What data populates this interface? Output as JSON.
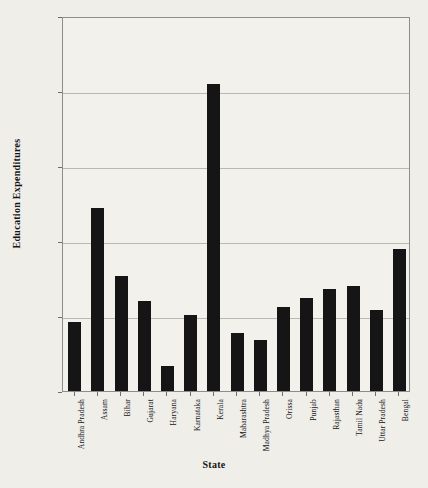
{
  "chart_data": {
    "type": "bar",
    "title": "",
    "xlabel": "State",
    "ylabel": "Education Expenditures",
    "categories": [
      "Andhra Pradesh",
      "Assam",
      "Bihar",
      "Gujarat",
      "Haryana",
      "Karnataka",
      "Kerala",
      "Maharashtra",
      "Madhya Pradesh",
      "Orissa",
      "Punjab",
      "Rajasthan",
      "Tamil Nadu",
      "Uttar Pradesh",
      "Bengal"
    ],
    "values": [
      0.196,
      0.272,
      0.227,
      0.21,
      0.167,
      0.201,
      0.355,
      0.189,
      0.184,
      0.206,
      0.212,
      0.218,
      0.22,
      0.204,
      0.245
    ],
    "ylim": [
      0.15,
      0.4
    ],
    "yticks": [
      0.15,
      0.2,
      0.25,
      0.3,
      0.35,
      0.4
    ],
    "ytick_labels": [
      "0.15",
      "0.2",
      "0.25",
      "0.3",
      "0.35",
      "0.4"
    ],
    "gridlines_y": [
      0.2,
      0.25,
      0.3,
      0.35
    ],
    "grid": true,
    "legend": "none",
    "bar_color": "#151515",
    "background_color": "#efeee9",
    "plot_background_color": "#f2f1ec",
    "frame_color": "#8d8d8d",
    "grid_color": "#b9b8b3"
  }
}
